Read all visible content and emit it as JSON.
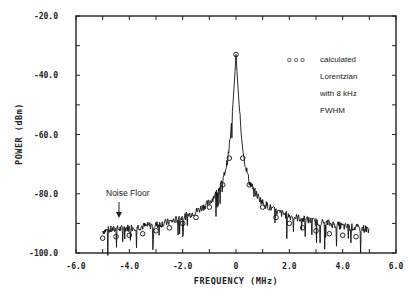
{
  "chart_data": {
    "type": "line",
    "title": "",
    "xlabel": "FREQUENCY (MHz)",
    "ylabel": "POWER (dBm)",
    "xlim": [
      -6.0,
      6.0
    ],
    "ylim": [
      -100.0,
      -20.0
    ],
    "x_ticks": [
      "-6.0",
      "-4.0",
      "-2.0",
      "0",
      "2.0",
      "4.0",
      "6.0"
    ],
    "y_ticks": [
      "-20.0",
      "-40.0",
      "-60.0",
      "-80.0",
      "-100.0"
    ],
    "grid": false,
    "legend": {
      "position": "upper right",
      "marker": "o o o",
      "lines": [
        "calculated",
        "Lorentzian",
        "with 8 kHz",
        "FWHM"
      ]
    },
    "annotations": [
      {
        "text": "Noise Floor",
        "x": -4.3,
        "y": -88.0,
        "arrow_to": [
          -4.3,
          -92.0
        ]
      }
    ],
    "series": [
      {
        "name": "measured spectrum",
        "style": "line",
        "x": [
          -5.0,
          -4.5,
          -4.0,
          -3.5,
          -3.0,
          -2.5,
          -2.0,
          -1.5,
          -1.0,
          -0.75,
          -0.5,
          -0.3,
          -0.2,
          -0.1,
          0.0,
          0.1,
          0.2,
          0.3,
          0.5,
          0.75,
          1.0,
          1.5,
          2.0,
          2.5,
          3.0,
          3.5,
          4.0,
          4.5,
          5.0
        ],
        "values": [
          -92.5,
          -92.0,
          -91.5,
          -91.0,
          -90.5,
          -89.5,
          -88.0,
          -86.0,
          -83.0,
          -80.0,
          -76.0,
          -68.0,
          -60.0,
          -48.0,
          -33.0,
          -48.0,
          -60.0,
          -68.0,
          -76.0,
          -80.0,
          -83.0,
          -86.0,
          -87.5,
          -88.5,
          -89.5,
          -90.0,
          -91.0,
          -91.5,
          -92.0
        ]
      },
      {
        "name": "calculated Lorentzian with 8 kHz FWHM",
        "style": "circles",
        "x": [
          -5.0,
          -4.5,
          -4.0,
          -3.5,
          -3.0,
          -2.5,
          -2.0,
          -1.5,
          -1.0,
          -0.5,
          -0.25,
          0.0,
          0.25,
          0.5,
          1.0,
          1.5,
          2.0,
          2.5,
          3.0,
          3.5,
          4.0,
          4.5
        ],
        "values": [
          -95.0,
          -94.5,
          -94.0,
          -93.5,
          -92.5,
          -91.5,
          -90.0,
          -88.0,
          -84.5,
          -77.0,
          -68.0,
          -33.0,
          -68.0,
          -77.0,
          -84.5,
          -88.0,
          -90.0,
          -91.5,
          -92.5,
          -93.5,
          -94.0,
          -94.5
        ]
      }
    ]
  }
}
